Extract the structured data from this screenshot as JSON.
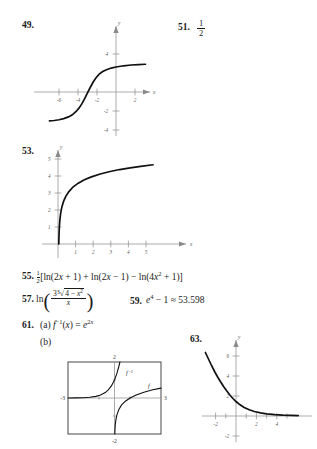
{
  "page": {
    "background": "#ffffff",
    "ink": "#1a1a1a"
  },
  "items": [
    {
      "number": "49.",
      "kind": "graph",
      "answer_text": ""
    },
    {
      "number": "51.",
      "kind": "fraction",
      "numerator": "1",
      "denominator": "2"
    },
    {
      "number": "53.",
      "kind": "graph",
      "answer_text": ""
    },
    {
      "number": "55.",
      "kind": "expression",
      "coefficient_num": "1",
      "coefficient_den": "2",
      "body": "[ln(2x + 1) + ln(2x − 1) − ln(4x² + 1)]",
      "parts": {
        "open_bracket": "[",
        "term1": "ln(2x + 1)",
        "plus": "+",
        "term2": "ln(2x − 1)",
        "minus": "−",
        "term3": "ln(4x² + 1)",
        "close_bracket": "]"
      }
    },
    {
      "number": "57.",
      "kind": "expression",
      "prefix": "ln",
      "numerator": "3∛(4 − x²)",
      "denominator": "x",
      "numerator_parts": {
        "coefficient": "3",
        "radical": "∛",
        "radicand": "4 − x²"
      }
    },
    {
      "number": "59.",
      "kind": "expression",
      "body": "e⁴ − 1 ≈ 53.598",
      "parts": {
        "base": "e",
        "exponent": "4",
        "minus_one": "− 1",
        "approx": "≈",
        "value": "53.598"
      }
    },
    {
      "number": "61.",
      "kind": "multipart",
      "part_a_label": "(a)",
      "part_a_body": "f⁻¹(x) = e²ˣ",
      "part_a_parts": {
        "func": "f",
        "inverse_exp": "−1",
        "arg": "(x) =",
        "rhs_base": "e",
        "rhs_exp": "2x"
      },
      "part_b_label": "(b)"
    },
    {
      "number": "63.",
      "kind": "graph",
      "answer_text": ""
    }
  ],
  "graphs": {
    "g49": {
      "id": "49",
      "type": "line",
      "description": "S-shaped increasing curve approaching horizontal asymptotes",
      "axis_label_x": "x",
      "axis_label_y": "y",
      "xticks": [
        -6,
        -4,
        -2,
        2
      ],
      "yticks": [
        4,
        -2,
        -4
      ],
      "xlim": [
        -7.2,
        3.2
      ],
      "ylim": [
        -5.0,
        5.0
      ],
      "grid": false,
      "points": [
        {
          "x": -7.0,
          "y": -3.05
        },
        {
          "x": -6.5,
          "y": -3.0
        },
        {
          "x": -6.0,
          "y": -2.92
        },
        {
          "x": -5.5,
          "y": -2.8
        },
        {
          "x": -5.0,
          "y": -2.62
        },
        {
          "x": -4.6,
          "y": -2.4
        },
        {
          "x": -4.2,
          "y": -2.05
        },
        {
          "x": -3.9,
          "y": -1.7
        },
        {
          "x": -3.6,
          "y": -1.25
        },
        {
          "x": -3.3,
          "y": -0.7
        },
        {
          "x": -3.0,
          "y": -0.1
        },
        {
          "x": -2.7,
          "y": 0.5
        },
        {
          "x": -2.4,
          "y": 1.05
        },
        {
          "x": -2.1,
          "y": 1.5
        },
        {
          "x": -1.8,
          "y": 1.85
        },
        {
          "x": -1.4,
          "y": 2.15
        },
        {
          "x": -1.0,
          "y": 2.35
        },
        {
          "x": -0.5,
          "y": 2.52
        },
        {
          "x": 0.0,
          "y": 2.63
        },
        {
          "x": 0.8,
          "y": 2.76
        },
        {
          "x": 1.6,
          "y": 2.84
        },
        {
          "x": 2.4,
          "y": 2.89
        },
        {
          "x": 3.1,
          "y": 2.92
        }
      ]
    },
    "g53": {
      "id": "53",
      "type": "line",
      "description": "Logarithmic curve rising steeply near zero then flattening",
      "axis_label_x": "x",
      "axis_label_y": "y",
      "xticks": [
        1,
        2,
        3,
        4,
        5
      ],
      "yticks": [
        1,
        2,
        3,
        4,
        5
      ],
      "xlim": [
        -0.35,
        6.0
      ],
      "ylim": [
        -0.45,
        5.6
      ],
      "grid": false,
      "points": [
        {
          "x": 0.045,
          "y": 0.0
        },
        {
          "x": 0.06,
          "y": 0.62
        },
        {
          "x": 0.08,
          "y": 1.05
        },
        {
          "x": 0.11,
          "y": 1.45
        },
        {
          "x": 0.15,
          "y": 1.8
        },
        {
          "x": 0.22,
          "y": 2.18
        },
        {
          "x": 0.32,
          "y": 2.52
        },
        {
          "x": 0.45,
          "y": 2.82
        },
        {
          "x": 0.62,
          "y": 3.08
        },
        {
          "x": 0.85,
          "y": 3.35
        },
        {
          "x": 1.15,
          "y": 3.58
        },
        {
          "x": 1.5,
          "y": 3.78
        },
        {
          "x": 1.9,
          "y": 3.95
        },
        {
          "x": 2.4,
          "y": 4.12
        },
        {
          "x": 2.9,
          "y": 4.25
        },
        {
          "x": 3.5,
          "y": 4.38
        },
        {
          "x": 4.1,
          "y": 4.48
        },
        {
          "x": 4.7,
          "y": 4.57
        },
        {
          "x": 5.4,
          "y": 4.66
        }
      ]
    },
    "g61b": {
      "id": "61b",
      "type": "line",
      "description": "Calculator viewing window with f and its inverse",
      "window_top": "2",
      "window_bottom": "-2",
      "window_left": "-3",
      "window_right": "3",
      "xlim": [
        -3,
        3
      ],
      "ylim": [
        -2,
        2
      ],
      "grid": false,
      "series": [
        {
          "name": "f⁻¹",
          "label": "f⁻¹",
          "points": [
            {
              "x": -3.0,
              "y": 0.0024
            },
            {
              "x": -2.5,
              "y": 0.0067
            },
            {
              "x": -2.0,
              "y": 0.018
            },
            {
              "x": -1.6,
              "y": 0.041
            },
            {
              "x": -1.2,
              "y": 0.091
            },
            {
              "x": -0.9,
              "y": 0.165
            },
            {
              "x": -0.6,
              "y": 0.3
            },
            {
              "x": -0.4,
              "y": 0.45
            },
            {
              "x": -0.2,
              "y": 0.67
            },
            {
              "x": 0.0,
              "y": 1.0
            },
            {
              "x": 0.15,
              "y": 1.35
            },
            {
              "x": 0.28,
              "y": 1.75
            },
            {
              "x": 0.35,
              "y": 2.0
            }
          ]
        },
        {
          "name": "f",
          "label": "f",
          "points": [
            {
              "x": 0.018,
              "y": -2.0
            },
            {
              "x": 0.03,
              "y": -1.75
            },
            {
              "x": 0.05,
              "y": -1.5
            },
            {
              "x": 0.09,
              "y": -1.2
            },
            {
              "x": 0.16,
              "y": -0.92
            },
            {
              "x": 0.28,
              "y": -0.64
            },
            {
              "x": 0.45,
              "y": -0.4
            },
            {
              "x": 0.7,
              "y": -0.18
            },
            {
              "x": 1.0,
              "y": 0.0
            },
            {
              "x": 1.4,
              "y": 0.17
            },
            {
              "x": 1.9,
              "y": 0.32
            },
            {
              "x": 2.4,
              "y": 0.44
            },
            {
              "x": 3.0,
              "y": 0.55
            }
          ]
        }
      ]
    },
    "g63": {
      "id": "63",
      "type": "line",
      "description": "Decaying exponential curve approaching the x-axis",
      "axis_label_x": "x",
      "axis_label_y": "y",
      "xticks": [
        -2,
        2,
        4
      ],
      "yticks": [
        2,
        4,
        6,
        -2
      ],
      "xlim": [
        -3.6,
        6.2
      ],
      "ylim": [
        -2.6,
        7.0
      ],
      "grid": false,
      "points": [
        {
          "x": -3.0,
          "y": 6.35
        },
        {
          "x": -2.7,
          "y": 5.7
        },
        {
          "x": -2.4,
          "y": 5.05
        },
        {
          "x": -2.1,
          "y": 4.45
        },
        {
          "x": -1.8,
          "y": 3.9
        },
        {
          "x": -1.5,
          "y": 3.4
        },
        {
          "x": -1.2,
          "y": 2.92
        },
        {
          "x": -0.9,
          "y": 2.5
        },
        {
          "x": -0.6,
          "y": 2.1
        },
        {
          "x": -0.3,
          "y": 1.75
        },
        {
          "x": 0.0,
          "y": 1.45
        },
        {
          "x": 0.4,
          "y": 1.12
        },
        {
          "x": 0.8,
          "y": 0.86
        },
        {
          "x": 1.3,
          "y": 0.62
        },
        {
          "x": 1.8,
          "y": 0.45
        },
        {
          "x": 2.4,
          "y": 0.31
        },
        {
          "x": 3.0,
          "y": 0.22
        },
        {
          "x": 3.8,
          "y": 0.14
        },
        {
          "x": 4.6,
          "y": 0.09
        },
        {
          "x": 5.4,
          "y": 0.06
        },
        {
          "x": 6.1,
          "y": 0.04
        }
      ]
    }
  }
}
